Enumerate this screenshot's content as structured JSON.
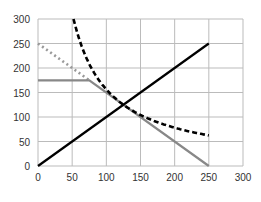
{
  "chart_data": {
    "type": "line",
    "title": "",
    "xlabel": "",
    "ylabel": "",
    "xlim": [
      0,
      300
    ],
    "ylim": [
      0,
      300
    ],
    "grid": true,
    "legend": "none",
    "x_ticks": [
      "0",
      "50",
      "100",
      "150",
      "200",
      "250",
      "300"
    ],
    "y_ticks": [
      "0",
      "50",
      "100",
      "150",
      "200",
      "250",
      "300"
    ],
    "series": [
      {
        "name": "black-solid-line",
        "style": "solid",
        "color": "#000000",
        "points": [
          [
            0,
            0
          ],
          [
            250,
            250
          ]
        ]
      },
      {
        "name": "black-dashed-curve",
        "style": "dashed",
        "color": "#000000",
        "function": "y = 15625 / x",
        "points": [
          [
            52,
            300
          ],
          [
            60,
            260
          ],
          [
            75,
            208
          ],
          [
            100,
            156
          ],
          [
            125,
            125
          ],
          [
            150,
            104
          ],
          [
            175,
            89
          ],
          [
            200,
            78
          ],
          [
            225,
            69
          ],
          [
            250,
            62.5
          ]
        ]
      },
      {
        "name": "gray-solid-line",
        "style": "solid",
        "color": "#888888",
        "points": [
          [
            0,
            175
          ],
          [
            75,
            175
          ],
          [
            250,
            0
          ]
        ]
      },
      {
        "name": "gray-dotted-line",
        "style": "dotted",
        "color": "#999999",
        "points": [
          [
            0,
            250
          ],
          [
            75,
            175
          ]
        ]
      }
    ]
  },
  "colors": {
    "grid": "#bbbbbb",
    "axis_text": "#333333"
  }
}
